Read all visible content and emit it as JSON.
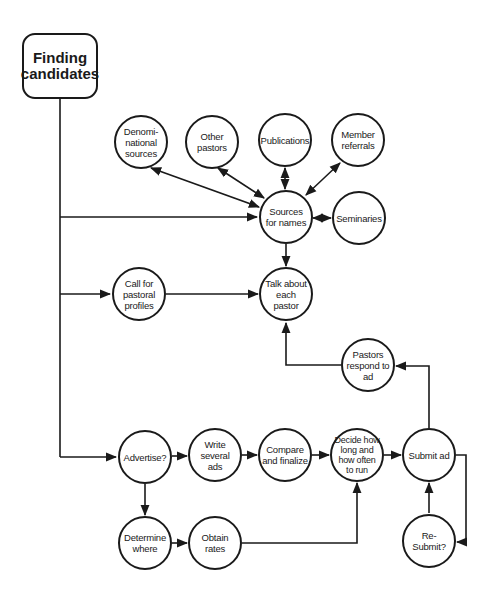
{
  "diagram": {
    "start": {
      "label": "Finding candidates"
    },
    "nodes": {
      "denominational": {
        "label": "Denomi-national sources"
      },
      "other_pastors": {
        "label": "Other pastors"
      },
      "publications": {
        "label": "Publications"
      },
      "member_referrals": {
        "label": "Member referrals"
      },
      "sources_for_names": {
        "label": "Sources for names"
      },
      "seminaries": {
        "label": "Seminaries"
      },
      "call_profiles": {
        "label": "Call for pastoral profiles"
      },
      "talk_about": {
        "label": "Talk about each pastor"
      },
      "pastors_respond": {
        "label": "Pastors respond to ad"
      },
      "advertise": {
        "label": "Advertise?"
      },
      "write_ads": {
        "label": "Write several ads"
      },
      "compare": {
        "label": "Compare and finalize"
      },
      "decide": {
        "label": "Decide how long and how often to run"
      },
      "submit_ad": {
        "label": "Submit ad"
      },
      "resubmit": {
        "label": "Re-Submit?"
      },
      "determine_where": {
        "label": "Determine where"
      },
      "obtain_rates": {
        "label": "Obtain rates"
      }
    },
    "edges": [
      {
        "from": "Finding candidates",
        "to": "Sources for names"
      },
      {
        "from": "Finding candidates",
        "to": "Call for pastoral profiles"
      },
      {
        "from": "Finding candidates",
        "to": "Advertise?"
      },
      {
        "from": "Sources for names",
        "to": "Denomi-national sources",
        "bidirectional": true
      },
      {
        "from": "Sources for names",
        "to": "Other pastors",
        "bidirectional": true
      },
      {
        "from": "Sources for names",
        "to": "Publications",
        "bidirectional": true
      },
      {
        "from": "Sources for names",
        "to": "Member referrals",
        "bidirectional": true
      },
      {
        "from": "Sources for names",
        "to": "Seminaries",
        "bidirectional": true
      },
      {
        "from": "Sources for names",
        "to": "Talk about each pastor"
      },
      {
        "from": "Call for pastoral profiles",
        "to": "Talk about each pastor"
      },
      {
        "from": "Pastors respond to ad",
        "to": "Talk about each pastor"
      },
      {
        "from": "Advertise?",
        "to": "Write several ads"
      },
      {
        "from": "Advertise?",
        "to": "Determine where"
      },
      {
        "from": "Write several ads",
        "to": "Compare and finalize"
      },
      {
        "from": "Compare and finalize",
        "to": "Decide how long and how often to run"
      },
      {
        "from": "Determine where",
        "to": "Obtain rates"
      },
      {
        "from": "Obtain rates",
        "to": "Decide how long and how often to run"
      },
      {
        "from": "Decide how long and how often to run",
        "to": "Submit ad"
      },
      {
        "from": "Submit ad",
        "to": "Pastors respond to ad"
      },
      {
        "from": "Submit ad",
        "to": "Re-Submit?"
      },
      {
        "from": "Re-Submit?",
        "to": "Submit ad"
      }
    ],
    "colors": {
      "stroke": "#1a1a1a",
      "background": "#ffffff"
    }
  }
}
